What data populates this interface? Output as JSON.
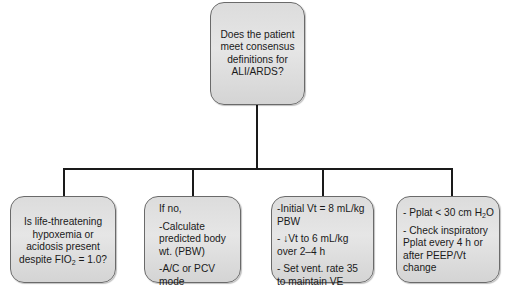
{
  "diagram": {
    "root": {
      "text": "Does the patient meet consensus definitions for ALI/ARDS?"
    },
    "children": [
      {
        "id": "hypoxemia-check",
        "lines": [
          "Is life-threatening hypoxemia or acidosis present despite FIO",
          "2",
          " = 1.0?"
        ]
      },
      {
        "id": "if-no",
        "items": [
          "If no,",
          "-Calculate predicted body wt. (PBW)",
          "-A/C or PCV mode"
        ]
      },
      {
        "id": "tidal-volume",
        "items": [
          "-Initial Vt = 8 mL/kg PBW",
          "- ↓Vt to 6 mL/kg over 2–4 h",
          "- Set vent. rate 35 to maintain VE"
        ]
      },
      {
        "id": "plateau-pressure",
        "items": [
          "- Pplat < 30 cm H",
          "2",
          "O",
          "- Check inspiratory Pplat every 4 h or after PEEP/Vt change"
        ]
      }
    ],
    "colors": {
      "box_fill": "#dedede",
      "box_border": "#6a6a6a",
      "connector": "#1a1a1a",
      "text": "#1a1a1a"
    }
  }
}
